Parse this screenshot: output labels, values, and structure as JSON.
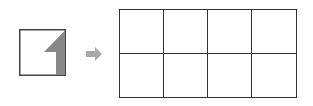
{
  "diagram": {
    "source_tile": {
      "shape": "square",
      "fill": "#ffffff",
      "border": "#444444",
      "mark": {
        "description": "gray shape in right portion with diagonal top edge",
        "color": "#888888"
      }
    },
    "arrow": {
      "direction": "right",
      "color": "#aaaaaa"
    },
    "target_grid": {
      "rows": 2,
      "columns": 4,
      "border": "#333333",
      "cells": [
        "",
        "",
        "",
        "",
        "",
        "",
        "",
        ""
      ]
    }
  }
}
